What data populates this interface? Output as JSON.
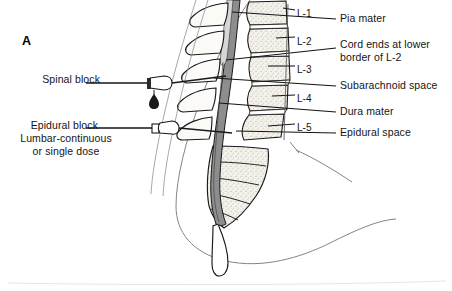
{
  "figure": {
    "panel_letter": "A",
    "title_alt": "Spinal and epidural block anatomy — lumbar region sagittal view"
  },
  "left_labels": [
    {
      "id": "spinal-block",
      "text": "Spinal block",
      "x": 76,
      "y": 79,
      "align": "right"
    },
    {
      "id": "epidural-block",
      "text": "Epidural block",
      "x": 74,
      "y": 125,
      "align": "right"
    },
    {
      "id": "epidural-sub-1",
      "text": "Lumbar-continuous",
      "x": 66,
      "y": 138,
      "align": "center"
    },
    {
      "id": "epidural-sub-2",
      "text": "or single dose",
      "x": 66,
      "y": 151,
      "align": "center"
    }
  ],
  "right_labels": [
    {
      "id": "pia-mater",
      "text": "Pia mater",
      "x": 340,
      "y": 17
    },
    {
      "id": "cord-ends-1",
      "text": "Cord ends at lower",
      "x": 340,
      "y": 43
    },
    {
      "id": "cord-ends-2",
      "text": "border of L-2",
      "x": 340,
      "y": 56
    },
    {
      "id": "subarachnoid-space",
      "text": "Subarachnoid space",
      "x": 340,
      "y": 84
    },
    {
      "id": "dura-mater",
      "text": "Dura mater",
      "x": 340,
      "y": 110
    },
    {
      "id": "epidural-space",
      "text": "Epidural space",
      "x": 340,
      "y": 131
    }
  ],
  "vertebra_labels": [
    {
      "id": "L-1",
      "text": "L-1",
      "x": 297,
      "y": 14
    },
    {
      "id": "L-2",
      "text": "L-2",
      "x": 297,
      "y": 41
    },
    {
      "id": "L-3",
      "text": "L-3",
      "x": 297,
      "y": 70
    },
    {
      "id": "L-4",
      "text": "L-4",
      "x": 297,
      "y": 99
    },
    {
      "id": "L-5",
      "text": "L-5",
      "x": 297,
      "y": 128
    }
  ],
  "colors": {
    "ink": "#141414",
    "bone_fill": "#f2efe7",
    "bone_stipple": "#8c8madd",
    "dura_gray": "#8e8e8e",
    "cord_light": "#d9d9d9",
    "body_outline": "#6f6f6f",
    "background": "#ffffff"
  },
  "annotations": {
    "needle_spinal": "spinal-needle-with-csf-drop",
    "needle_epidural": "epidural-needle",
    "csf_drop": "csf-droplet"
  }
}
